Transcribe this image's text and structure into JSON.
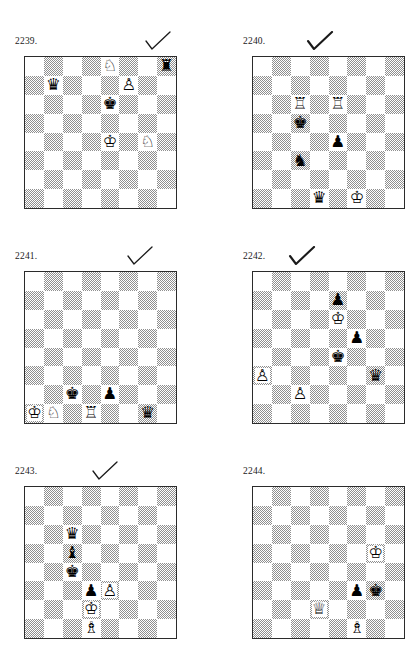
{
  "page": {
    "type": "chess-puzzle-worksheet",
    "width": 420,
    "height": 669,
    "background_color": "#ffffff",
    "board_light_color": "#ffffff",
    "board_dark_color": "#8f8f8f",
    "border_color": "#2b2b2b",
    "checkmark_color": "#1a1a1a"
  },
  "glyphs": {
    "white_king": "♔",
    "white_queen": "♕",
    "white_rook": "♖",
    "white_bishop": "♗",
    "white_knight": "♘",
    "white_pawn": "♙",
    "black_king": "♚",
    "black_queen": "♛",
    "black_rook": "♜",
    "black_bishop": "♝",
    "black_knight": "♞",
    "black_pawn": "♟"
  },
  "puzzles": [
    {
      "number": "2239.",
      "checked": true,
      "check_offset_x": 128,
      "position_x": 15,
      "position_y": 34,
      "pieces": [
        {
          "color": "white",
          "type": "knight",
          "file": 4,
          "rank": 0,
          "square": "e8",
          "glyph": "♘"
        },
        {
          "color": "black",
          "type": "rook",
          "file": 7,
          "rank": 0,
          "square": "h8",
          "glyph": "♜"
        },
        {
          "color": "black",
          "type": "queen",
          "file": 1,
          "rank": 1,
          "square": "b7",
          "glyph": "♛"
        },
        {
          "color": "white",
          "type": "pawn",
          "file": 5,
          "rank": 1,
          "square": "f7",
          "glyph": "♙"
        },
        {
          "color": "black",
          "type": "king",
          "file": 4,
          "rank": 2,
          "square": "e6",
          "glyph": "♚"
        },
        {
          "color": "white",
          "type": "king",
          "file": 4,
          "rank": 4,
          "square": "e4",
          "glyph": "♔"
        },
        {
          "color": "white",
          "type": "knight",
          "file": 6,
          "rank": 4,
          "square": "g4",
          "glyph": "♘"
        }
      ]
    },
    {
      "number": "2240.",
      "checked": true,
      "check_offset_x": 62,
      "position_x": 243,
      "position_y": 34,
      "pieces": [
        {
          "color": "white",
          "type": "rook",
          "file": 2,
          "rank": 2,
          "square": "c6",
          "glyph": "♖"
        },
        {
          "color": "white",
          "type": "rook",
          "file": 4,
          "rank": 2,
          "square": "e6",
          "glyph": "♖"
        },
        {
          "color": "black",
          "type": "king",
          "file": 2,
          "rank": 3,
          "square": "c5",
          "glyph": "♚"
        },
        {
          "color": "black",
          "type": "pawn",
          "file": 4,
          "rank": 4,
          "square": "e4",
          "glyph": "♟"
        },
        {
          "color": "black",
          "type": "knight",
          "file": 2,
          "rank": 5,
          "square": "c3",
          "glyph": "♞"
        },
        {
          "color": "black",
          "type": "queen",
          "file": 3,
          "rank": 7,
          "square": "d1",
          "glyph": "♛"
        },
        {
          "color": "white",
          "type": "king",
          "file": 5,
          "rank": 7,
          "square": "f1",
          "glyph": "♔"
        }
      ]
    },
    {
      "number": "2241.",
      "checked": true,
      "check_offset_x": 110,
      "position_x": 15,
      "position_y": 249,
      "pieces": [
        {
          "color": "black",
          "type": "king",
          "file": 2,
          "rank": 6,
          "square": "c2",
          "glyph": "♚"
        },
        {
          "color": "black",
          "type": "pawn",
          "file": 4,
          "rank": 6,
          "square": "e2",
          "glyph": "♟"
        },
        {
          "color": "white",
          "type": "king",
          "file": 0,
          "rank": 7,
          "square": "a1",
          "glyph": "♔"
        },
        {
          "color": "white",
          "type": "knight",
          "file": 1,
          "rank": 7,
          "square": "b1",
          "glyph": "♘"
        },
        {
          "color": "white",
          "type": "rook",
          "file": 3,
          "rank": 7,
          "square": "d1",
          "glyph": "♖"
        },
        {
          "color": "black",
          "type": "queen",
          "file": 6,
          "rank": 7,
          "square": "g1",
          "glyph": "♛"
        }
      ]
    },
    {
      "number": "2242.",
      "checked": true,
      "check_offset_x": 44,
      "position_x": 243,
      "position_y": 249,
      "pieces": [
        {
          "color": "black",
          "type": "pawn",
          "file": 4,
          "rank": 1,
          "square": "e7",
          "glyph": "♟"
        },
        {
          "color": "white",
          "type": "king",
          "file": 4,
          "rank": 2,
          "square": "e6",
          "glyph": "♔"
        },
        {
          "color": "black",
          "type": "pawn",
          "file": 5,
          "rank": 3,
          "square": "f5",
          "glyph": "♟"
        },
        {
          "color": "black",
          "type": "king",
          "file": 4,
          "rank": 4,
          "square": "e4",
          "glyph": "♚"
        },
        {
          "color": "white",
          "type": "pawn",
          "file": 0,
          "rank": 5,
          "square": "a3",
          "glyph": "♙"
        },
        {
          "color": "black",
          "type": "queen",
          "file": 6,
          "rank": 5,
          "square": "g3",
          "glyph": "♛"
        },
        {
          "color": "white",
          "type": "pawn",
          "file": 2,
          "rank": 6,
          "square": "c2",
          "glyph": "♙"
        }
      ]
    },
    {
      "number": "2243.",
      "checked": true,
      "check_offset_x": 75,
      "position_x": 15,
      "position_y": 464,
      "pieces": [
        {
          "color": "black",
          "type": "queen",
          "file": 2,
          "rank": 2,
          "square": "c6",
          "glyph": "♛"
        },
        {
          "color": "black",
          "type": "bishop",
          "file": 2,
          "rank": 3,
          "square": "c5",
          "glyph": "♝"
        },
        {
          "color": "black",
          "type": "king",
          "file": 2,
          "rank": 4,
          "square": "c4",
          "glyph": "♚"
        },
        {
          "color": "black",
          "type": "pawn",
          "file": 3,
          "rank": 5,
          "square": "d3",
          "glyph": "♟"
        },
        {
          "color": "white",
          "type": "pawn",
          "file": 4,
          "rank": 5,
          "square": "e3",
          "glyph": "♙"
        },
        {
          "color": "white",
          "type": "king",
          "file": 3,
          "rank": 6,
          "square": "d2",
          "glyph": "♔"
        },
        {
          "color": "white",
          "type": "bishop",
          "file": 3,
          "rank": 7,
          "square": "d1",
          "glyph": "♗"
        }
      ]
    },
    {
      "number": "2244.",
      "checked": false,
      "check_offset_x": 0,
      "position_x": 243,
      "position_y": 464,
      "pieces": [
        {
          "color": "white",
          "type": "king",
          "file": 6,
          "rank": 3,
          "square": "g5",
          "glyph": "♔"
        },
        {
          "color": "black",
          "type": "pawn",
          "file": 5,
          "rank": 5,
          "square": "f3",
          "glyph": "♟"
        },
        {
          "color": "black",
          "type": "king",
          "file": 6,
          "rank": 5,
          "square": "g3",
          "glyph": "♚"
        },
        {
          "color": "white",
          "type": "queen",
          "file": 3,
          "rank": 6,
          "square": "d2",
          "glyph": "♕"
        },
        {
          "color": "white",
          "type": "bishop",
          "file": 5,
          "rank": 7,
          "square": "f1",
          "glyph": "♗"
        }
      ]
    }
  ]
}
